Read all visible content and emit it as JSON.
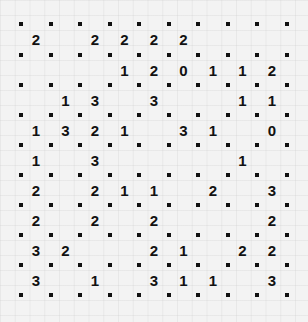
{
  "puzzle": {
    "type": "slitherlink",
    "rows": 9,
    "cols": 9,
    "grid": [
      [
        "2",
        "",
        "2",
        "2",
        "2",
        "2",
        "",
        "",
        ""
      ],
      [
        "",
        "",
        "",
        "1",
        "2",
        "0",
        "1",
        "1",
        "2"
      ],
      [
        "",
        "1",
        "3",
        "",
        "3",
        "",
        "",
        "1",
        "1"
      ],
      [
        "1",
        "3",
        "2",
        "1",
        "",
        "3",
        "1",
        "",
        "0"
      ],
      [
        "1",
        "",
        "3",
        "",
        "",
        "",
        "",
        "1",
        ""
      ],
      [
        "2",
        "",
        "2",
        "1",
        "1",
        "",
        "2",
        "",
        "3"
      ],
      [
        "2",
        "",
        "2",
        "",
        "2",
        "",
        "",
        "",
        "2"
      ],
      [
        "3",
        "2",
        "",
        "",
        "2",
        "1",
        "",
        "2",
        "2"
      ],
      [
        "3",
        "",
        "1",
        "",
        "3",
        "1",
        "1",
        "",
        "3"
      ]
    ]
  },
  "layout": {
    "dot_x": [
      21,
      51,
      80,
      110,
      139,
      169,
      198,
      228,
      257,
      287
    ],
    "dot_y": [
      24,
      55,
      85,
      115,
      145,
      175,
      205,
      235,
      265,
      295
    ]
  },
  "colors": {
    "background": "#f3f3f3",
    "ink": "#111111"
  }
}
